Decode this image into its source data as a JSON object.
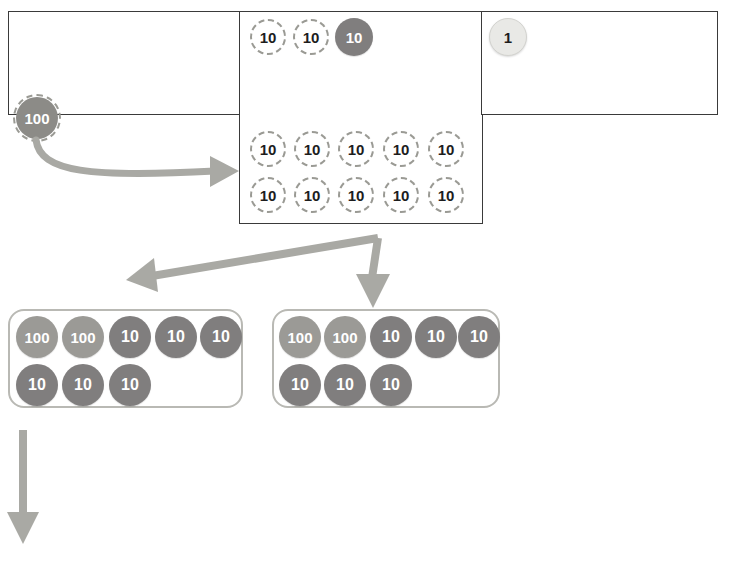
{
  "place_value_table": {
    "columns": [
      {
        "name": "hundreds-column",
        "label": ""
      },
      {
        "name": "tens-column",
        "label": ""
      },
      {
        "name": "ones-column",
        "label": ""
      }
    ],
    "hundreds": {
      "counters": []
    },
    "tens": {
      "top_row": [
        {
          "value": "10",
          "style": "outline"
        },
        {
          "value": "10",
          "style": "outline"
        },
        {
          "value": "10",
          "style": "solid"
        }
      ],
      "second_row": [
        {
          "value": "10",
          "style": "outline"
        },
        {
          "value": "10",
          "style": "outline"
        },
        {
          "value": "10",
          "style": "outline"
        },
        {
          "value": "10",
          "style": "outline"
        },
        {
          "value": "10",
          "style": "outline"
        }
      ],
      "third_row": [
        {
          "value": "10",
          "style": "outline"
        },
        {
          "value": "10",
          "style": "outline"
        },
        {
          "value": "10",
          "style": "outline"
        },
        {
          "value": "10",
          "style": "outline"
        },
        {
          "value": "10",
          "style": "outline"
        }
      ]
    },
    "ones": {
      "counters": [
        {
          "value": "1",
          "style": "pale"
        }
      ]
    }
  },
  "dragged_counter": {
    "value": "100",
    "style": "solid-dashed-ring"
  },
  "groups": [
    {
      "name": "group-left",
      "row1": [
        "100",
        "100",
        "10",
        "10",
        "10"
      ],
      "row2": [
        "10",
        "10",
        "10"
      ]
    },
    {
      "name": "group-right",
      "row1": [
        "100",
        "100",
        "10",
        "10",
        "10"
      ],
      "row2": [
        "10",
        "10",
        "10"
      ]
    }
  ],
  "arrows": [
    {
      "name": "arrow-hundred-to-tens",
      "direction": "right"
    },
    {
      "name": "arrow-split-left",
      "direction": "left-down"
    },
    {
      "name": "arrow-split-down",
      "direction": "down"
    },
    {
      "name": "arrow-group-continue-down",
      "direction": "down"
    }
  ],
  "colors": {
    "table_border": "#3a3a3a",
    "group_border": "#b9b9b4",
    "counter_ten": "#807e7e",
    "counter_hundred": "#9b9a96",
    "counter_one": "#e9e9e6",
    "outline_dash": "#9a9a94",
    "arrow": "#a9a9a4"
  }
}
